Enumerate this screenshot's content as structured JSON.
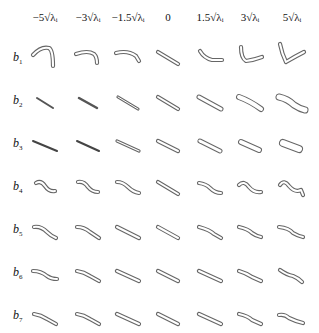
{
  "figure": {
    "column_headers": [
      "−5√λᵢ",
      "−3√λᵢ",
      "−1.5√λᵢ",
      "0",
      "1.5√λᵢ",
      "3√λᵢ",
      "5√λᵢ"
    ],
    "row_labels": [
      {
        "base": "b",
        "sub": "1"
      },
      {
        "base": "b",
        "sub": "2"
      },
      {
        "base": "b",
        "sub": "3"
      },
      {
        "base": "b",
        "sub": "4"
      },
      {
        "base": "b",
        "sub": "5"
      },
      {
        "base": "b",
        "sub": "6"
      },
      {
        "base": "b",
        "sub": "7"
      }
    ]
  }
}
